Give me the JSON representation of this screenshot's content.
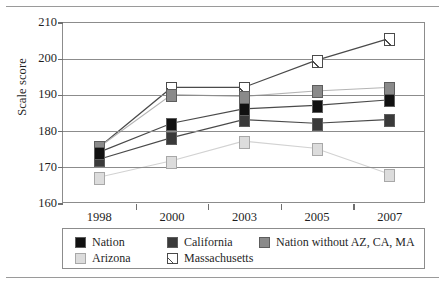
{
  "chart_data": {
    "type": "line",
    "title": "",
    "xlabel": "",
    "ylabel": "Scale score",
    "categories": [
      "1998",
      "2000",
      "2003",
      "2005",
      "2007"
    ],
    "ylim": [
      160,
      210
    ],
    "yticks": [
      160,
      170,
      180,
      190,
      200,
      210
    ],
    "grid": true,
    "legend_position": "bottom",
    "series": [
      {
        "name": "Nation",
        "color": "#111111",
        "values": [
          174,
          182,
          186,
          187,
          188.5
        ]
      },
      {
        "name": "California",
        "color": "#3a3a3a",
        "values": [
          172,
          178,
          183,
          182,
          183
        ]
      },
      {
        "name": "Nation without AZ, CA, MA",
        "color": "#8a8a8a",
        "values": [
          175.5,
          190,
          189.5,
          191,
          192
        ]
      },
      {
        "name": "Arizona",
        "color": "#dcdcdc",
        "values": [
          167,
          171.5,
          177,
          175,
          168
        ]
      },
      {
        "name": "Massachusetts",
        "color": "#ffffff",
        "hatch": "diagonal",
        "values": [
          175.5,
          192,
          192,
          199.5,
          205.5
        ]
      }
    ]
  },
  "axis": {
    "y_tick_labels": [
      "210",
      "200",
      "190",
      "180",
      "170",
      "160"
    ],
    "x_tick_labels": [
      "1998",
      "2000",
      "2003",
      "2005",
      "2007"
    ],
    "y_axis_title": "Scale score"
  },
  "legend": {
    "entries": [
      {
        "label": "Nation",
        "swatch": "black-square-icon"
      },
      {
        "label": "California",
        "swatch": "dark-gray-square-icon"
      },
      {
        "label": "Nation without AZ, CA, MA",
        "swatch": "medium-gray-square-icon"
      },
      {
        "label": "Arizona",
        "swatch": "light-gray-square-icon"
      },
      {
        "label": "Massachusetts",
        "swatch": "hatched-square-icon"
      }
    ]
  }
}
